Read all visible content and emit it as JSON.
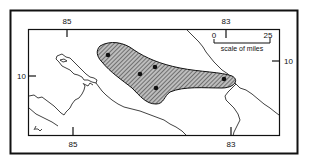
{
  "figure": {
    "colors": {
      "ink": "#111111",
      "background": "#ffffff",
      "hatch": "#444444"
    },
    "longitude_labels": {
      "top_left": "85",
      "top_right": "83",
      "bottom_left": "85",
      "bottom_right": "83"
    },
    "latitude_labels": {
      "left": "10",
      "right": "10"
    },
    "scale_bar": {
      "start_label": "0",
      "end_label": "25",
      "caption": "scale of miles"
    },
    "shaded_region": {
      "pattern": "diagonal-hatch",
      "points": [
        {
          "x": 108,
          "y": 55
        },
        {
          "x": 140,
          "y": 74
        },
        {
          "x": 155,
          "y": 67
        },
        {
          "x": 156,
          "y": 88
        },
        {
          "x": 224,
          "y": 79
        }
      ]
    },
    "signature_mark": "~"
  }
}
